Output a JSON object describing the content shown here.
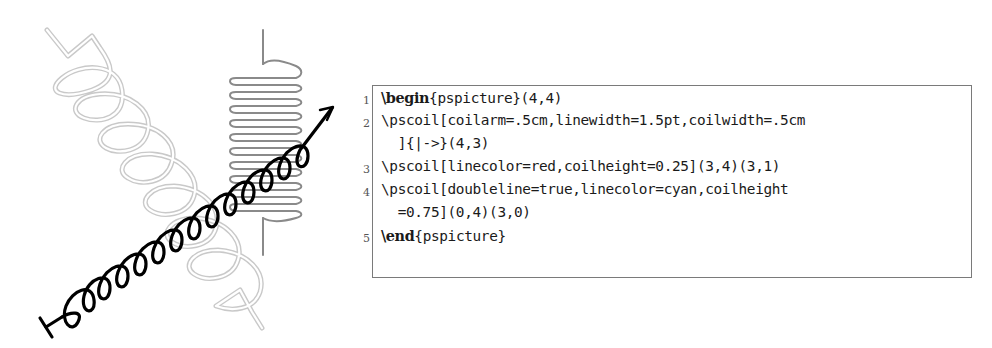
{
  "figure": {
    "coils": [
      {
        "name": "black-arrow-coil",
        "from": [
          0,
          0
        ],
        "to": [
          4,
          3
        ],
        "linecolor": "#000000",
        "linewidth": "1.5pt",
        "coilwidth": ".5cm",
        "coilarm": ".5cm",
        "arrows": "|->"
      },
      {
        "name": "red-vertical-coil",
        "from": [
          3,
          4
        ],
        "to": [
          3,
          1
        ],
        "linecolor": "#808080",
        "coilheight": "0.25"
      },
      {
        "name": "cyan-double-coil",
        "from": [
          0,
          4
        ],
        "to": [
          3,
          0
        ],
        "linecolor": "#d0d0d0",
        "doubleline": true,
        "coilheight": "0.75"
      }
    ]
  },
  "code": {
    "lines": [
      {
        "number": "1",
        "keyword": "\\begin",
        "rest": "{pspicture}(4,4)"
      },
      {
        "number": "2",
        "prefix": "\\pscoil[coilarm=.5cm,linewidth=1.5pt,coilwidth=.5cm"
      },
      {
        "number": "",
        "prefix": "  ]{|->}(4,3)"
      },
      {
        "number": "3",
        "prefix": "\\pscoil[linecolor=red,coilheight=0.25](3,4)(3,1)"
      },
      {
        "number": "4",
        "prefix": "\\pscoil[doubleline=true,linecolor=cyan,coilheight"
      },
      {
        "number": "",
        "prefix": "  =0.75](0,4)(3,0)"
      },
      {
        "number": "5",
        "keyword": "\\end",
        "rest": "{pspicture}"
      }
    ]
  }
}
